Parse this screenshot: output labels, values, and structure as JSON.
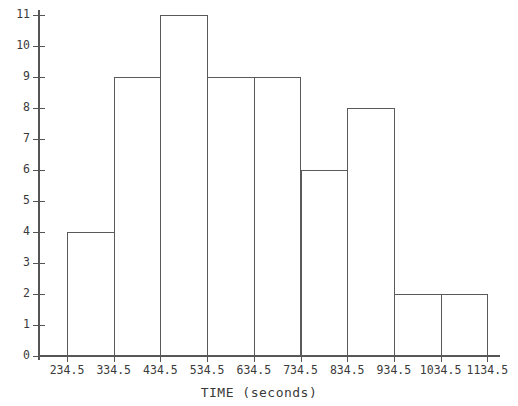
{
  "chart_data": {
    "type": "bar",
    "title": "",
    "xlabel": "TIME (seconds)",
    "ylabel": "",
    "bin_edges": [
      234.5,
      334.5,
      434.5,
      534.5,
      634.5,
      734.5,
      834.5,
      934.5,
      1034.5,
      1134.5
    ],
    "categories": [
      "234.5-334.5",
      "334.5-434.5",
      "434.5-534.5",
      "534.5-634.5",
      "634.5-734.5",
      "734.5-834.5",
      "834.5-934.5",
      "934.5-1034.5",
      "1034.5-1134.5"
    ],
    "values": [
      4,
      9,
      11,
      9,
      9,
      6,
      8,
      2,
      2
    ],
    "x_tick_labels": [
      "234.5",
      "334.5",
      "434.5",
      "534.5",
      "634.5",
      "734.5",
      "834.5",
      "934.5",
      "1034.5",
      "1134.5"
    ],
    "y_tick_labels": [
      "0",
      "1",
      "2",
      "3",
      "4",
      "5",
      "6",
      "7",
      "8",
      "9",
      "10",
      "11"
    ],
    "y_ticks": [
      0,
      1,
      2,
      3,
      4,
      5,
      6,
      7,
      8,
      9,
      10,
      11
    ],
    "ylim": [
      0,
      11
    ],
    "xlim": [
      234.5,
      1134.5
    ],
    "grid": false,
    "legend": false,
    "bar_fill_color": "#ffffff",
    "bar_edge_color": "#5a5a5a",
    "axis_color": "#555555",
    "text_color": "#3a3a3a"
  }
}
